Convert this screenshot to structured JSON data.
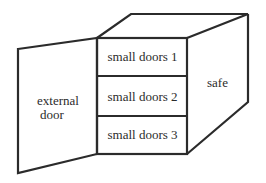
{
  "diagram": {
    "type": "safe-with-compartments",
    "line_color": "#2b2b2b",
    "background": "#ffffff",
    "labels": {
      "external_door": [
        "external",
        "door"
      ],
      "safe": "safe"
    },
    "compartments": [
      {
        "label": "small doors 1"
      },
      {
        "label": "small doors 2"
      },
      {
        "label": "small doors 3"
      }
    ]
  }
}
